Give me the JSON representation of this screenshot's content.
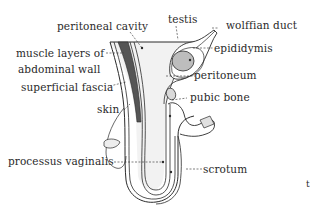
{
  "diagram": {
    "labels": {
      "peritoneal_cavity": "peritoneal cavity",
      "testis": "testis",
      "wolffian_duct": "wolffian duct",
      "muscle_layers_line1": "muscle layers of",
      "muscle_layers_line2": "abdominal wall",
      "epididymis": "epididymis",
      "superficial_fascia": "superficial fascia",
      "peritoneum": "peritoneum",
      "skin": "skin",
      "pubic_bone": "pubic bone",
      "processus_vaginalis": "processus vaginalis",
      "scrotum": "scrotum",
      "corner_mark": "t"
    },
    "colors": {
      "ink": "#2a2a2a",
      "muscle_fill": "#555555",
      "testis_fill": "#bdbdbd",
      "cavity_fill": "#f0f0f0",
      "background": "#ffffff"
    }
  }
}
